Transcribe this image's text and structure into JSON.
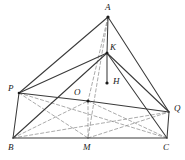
{
  "figure": {
    "width": 185,
    "height": 160,
    "background_color": "#ffffff",
    "stroke_color": "#3a3a3a",
    "dashed_color": "#8a8a8a",
    "label_color": "#1a1a1a"
  },
  "labels": {
    "a": "A",
    "k": "K",
    "h": "H",
    "p": "P",
    "o": "O",
    "q": "Q",
    "b": "B",
    "m": "M",
    "c": "C"
  },
  "points": {
    "A": {
      "x": 108,
      "y": 17,
      "label": "A",
      "label_x": 105,
      "label_y": 3
    },
    "K": {
      "x": 107,
      "y": 53,
      "label": "K",
      "label_x": 110,
      "label_y": 43
    },
    "H": {
      "x": 107,
      "y": 83,
      "label": "H",
      "label_x": 113,
      "label_y": 77
    },
    "P": {
      "x": 19,
      "y": 93,
      "label": "P",
      "label_x": 8,
      "label_y": 84
    },
    "O": {
      "x": 88,
      "y": 101,
      "label": "O",
      "label_x": 74,
      "label_y": 88
    },
    "Q": {
      "x": 169,
      "y": 112,
      "label": "Q",
      "label_x": 174,
      "label_y": 104
    },
    "B": {
      "x": 13,
      "y": 138,
      "label": "B",
      "label_x": 8,
      "label_y": 143
    },
    "M": {
      "x": 88,
      "y": 138,
      "label": "M",
      "label_x": 83,
      "label_y": 143
    },
    "C": {
      "x": 167,
      "y": 138,
      "label": "C",
      "label_x": 163,
      "label_y": 143
    }
  },
  "solid_edges": [
    {
      "name": "edge-A-P",
      "from": "A",
      "to": "P"
    },
    {
      "name": "edge-A-Q",
      "from": "A",
      "to": "Q"
    },
    {
      "name": "edge-A-K",
      "from": "A",
      "to": "K"
    },
    {
      "name": "edge-K-P",
      "from": "K",
      "to": "P"
    },
    {
      "name": "edge-K-Q",
      "from": "K",
      "to": "Q"
    },
    {
      "name": "edge-K-H",
      "from": "K",
      "to": "H"
    },
    {
      "name": "edge-P-O",
      "from": "P",
      "to": "O"
    },
    {
      "name": "edge-O-Q",
      "from": "O",
      "to": "Q"
    },
    {
      "name": "edge-P-B",
      "from": "P",
      "to": "B"
    },
    {
      "name": "edge-Q-C",
      "from": "Q",
      "to": "C"
    },
    {
      "name": "edge-B-M",
      "from": "B",
      "to": "M"
    },
    {
      "name": "edge-M-C",
      "from": "M",
      "to": "C"
    },
    {
      "name": "edge-B-K",
      "from": "B",
      "to": "K"
    },
    {
      "name": "edge-C-K",
      "from": "C",
      "to": "K"
    }
  ],
  "dashed_edges": [
    {
      "name": "edge-A-M-dashed",
      "from": "A",
      "to": "M"
    },
    {
      "name": "edge-A-O-dashed",
      "from": "A",
      "to": "O"
    },
    {
      "name": "edge-B-Q-dashed",
      "from": "B",
      "to": "Q"
    },
    {
      "name": "edge-P-C-dashed",
      "from": "P",
      "to": "C"
    },
    {
      "name": "edge-B-O-dashed",
      "from": "B",
      "to": "O"
    },
    {
      "name": "edge-O-C-dashed",
      "from": "O",
      "to": "C"
    },
    {
      "name": "edge-P-M-dashed",
      "from": "P",
      "to": "M"
    },
    {
      "name": "edge-M-Q-dashed",
      "from": "M",
      "to": "Q"
    },
    {
      "name": "edge-O-M-dashed",
      "from": "O",
      "to": "M"
    }
  ],
  "dots": [
    {
      "name": "dot-A",
      "at": "A",
      "r": 1.6
    },
    {
      "name": "dot-K",
      "at": "K",
      "r": 1.5
    },
    {
      "name": "dot-H",
      "at": "H",
      "r": 1.6
    },
    {
      "name": "dot-O",
      "at": "O",
      "r": 1.6
    },
    {
      "name": "dot-P",
      "at": "P",
      "r": 1.3
    }
  ]
}
